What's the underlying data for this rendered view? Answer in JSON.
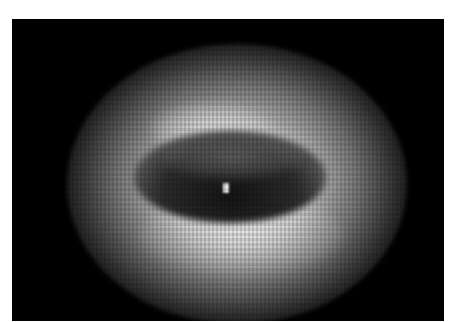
{
  "image": {
    "description": "Grayscale blurry image of a bright elliptical ring with a dark oval cavity in the center and a small bright spot",
    "colors": {
      "background": "#ffffff",
      "panel": "#000000",
      "ring": "#d8d8d8",
      "cavity": "#202020",
      "hotspot": "#f0f0f0"
    }
  }
}
